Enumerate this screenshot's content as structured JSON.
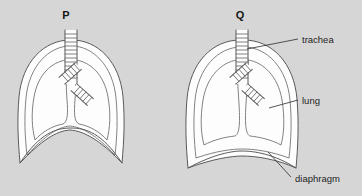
{
  "figure": {
    "title_p": "P",
    "title_q": "Q",
    "background_color": "#d6d6d6",
    "outline_color": "#5a5a5a",
    "organ_fill_color": "#fdfdfd",
    "leader_color": "#2b2b2b",
    "panels": [
      {
        "id": "P",
        "letter": "P",
        "letter_x": 66,
        "letter_y": 19,
        "diaphragm_state": "domed",
        "chest_state": "narrow"
      },
      {
        "id": "Q",
        "letter": "Q",
        "letter_x": 240,
        "letter_y": 19,
        "diaphragm_state": "flattened",
        "chest_state": "expanded"
      }
    ],
    "callouts": [
      {
        "id": "trachea",
        "label": "trachea",
        "text_x": 302,
        "text_y": 43,
        "leader_from_x": 298,
        "leader_from_y": 39,
        "leader_to_x": 247,
        "leader_to_y": 49,
        "target": "trachea"
      },
      {
        "id": "lung",
        "label": "lung",
        "text_x": 302,
        "text_y": 104,
        "leader_from_x": 298,
        "leader_from_y": 100,
        "leader_to_x": 269,
        "leader_to_y": 108,
        "target": "lung"
      },
      {
        "id": "diaphragm",
        "label": "diaphragm",
        "text_x": 295,
        "text_y": 182,
        "leader_from_x": 291,
        "leader_from_y": 177,
        "leader_to_x": 268,
        "leader_to_y": 152,
        "target": "diaphragm"
      }
    ],
    "icons": {
      "trachea_rings": "cartilage-ring-stack",
      "bronchus_rings": "bronchus-ring-stack"
    }
  }
}
